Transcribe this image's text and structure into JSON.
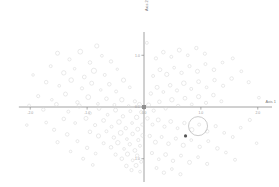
{
  "chart_data": {
    "type": "scatter",
    "title": "",
    "subtitle": "",
    "xlabel": "Axis 1",
    "ylabel": "Axis 2",
    "xlim": [
      -2.2,
      2.25
    ],
    "ylim": [
      -1.45,
      1.45
    ],
    "xticks": [
      -2.0,
      -1.0,
      0.0,
      1.0,
      2.0
    ],
    "xticklabels": [
      "-2.0",
      "-1.0",
      "0.0",
      "1.0",
      "2.0"
    ],
    "yticks": [
      1.0,
      0.0,
      -1.0
    ],
    "yticklabels": [
      "1.0",
      "0.0",
      "-1.0"
    ],
    "grid": false,
    "legend": null,
    "legend_position": "none",
    "marker_style": "open-circle",
    "marker_color": "#d8d8d8",
    "annotations": [
      {
        "label": "large open circle",
        "x": 0.95,
        "y": -0.37,
        "size": 9.5
      },
      {
        "label": "dark filled marker",
        "x": 0.73,
        "y": -0.56,
        "size": 3.2
      },
      {
        "label": "dark cluster at origin",
        "x": 0.0,
        "y": 0.0,
        "size": 4.0
      }
    ],
    "series": [
      {
        "name": "samples",
        "points": [
          [
            -1.52,
            1.04,
            2.0
          ],
          [
            -1.31,
            0.92,
            1.6
          ],
          [
            -1.12,
            1.07,
            2.4
          ],
          [
            -0.95,
            0.86,
            1.8
          ],
          [
            -0.83,
            1.18,
            2.1
          ],
          [
            -0.74,
            0.99,
            1.4
          ],
          [
            -1.64,
            0.79,
            1.5
          ],
          [
            -1.41,
            0.66,
            2.2
          ],
          [
            -1.22,
            0.74,
            1.3
          ],
          [
            -1.05,
            0.58,
            1.9
          ],
          [
            -0.88,
            0.7,
            2.6
          ],
          [
            -0.69,
            0.62,
            1.5
          ],
          [
            -0.58,
            0.88,
            1.7
          ],
          [
            -0.47,
            0.73,
            1.2
          ],
          [
            -1.72,
            0.48,
            1.8
          ],
          [
            -1.49,
            0.41,
            1.4
          ],
          [
            -1.28,
            0.52,
            2.3
          ],
          [
            -1.09,
            0.36,
            1.6
          ],
          [
            -0.92,
            0.46,
            2.0
          ],
          [
            -0.76,
            0.33,
            1.3
          ],
          [
            -0.61,
            0.44,
            1.8
          ],
          [
            -0.49,
            0.3,
            1.5
          ],
          [
            -0.36,
            0.52,
            2.1
          ],
          [
            -0.25,
            0.38,
            1.4
          ],
          [
            -1.86,
            0.21,
            1.6
          ],
          [
            -1.62,
            0.14,
            1.3
          ],
          [
            -1.38,
            0.25,
            2.0
          ],
          [
            -1.17,
            0.09,
            1.7
          ],
          [
            -0.98,
            0.19,
            2.4
          ],
          [
            -0.81,
            0.06,
            1.4
          ],
          [
            -0.66,
            0.16,
            1.8
          ],
          [
            -0.52,
            0.04,
            1.5
          ],
          [
            -0.39,
            0.14,
            2.2
          ],
          [
            -0.27,
            0.02,
            1.3
          ],
          [
            -0.16,
            0.11,
            1.6
          ],
          [
            -0.08,
            0.05,
            2.0
          ],
          [
            -2.02,
            0.03,
            1.4
          ],
          [
            -1.77,
            -0.05,
            1.7
          ],
          [
            -1.54,
            0.05,
            1.9
          ],
          [
            -1.33,
            -0.09,
            1.5
          ],
          [
            -1.14,
            0.02,
            2.1
          ],
          [
            -0.95,
            -0.12,
            1.6
          ],
          [
            -0.79,
            -0.03,
            1.8
          ],
          [
            -0.64,
            -0.15,
            1.4
          ],
          [
            -0.5,
            -0.06,
            2.0
          ],
          [
            -0.37,
            -0.18,
            1.7
          ],
          [
            -0.24,
            -0.08,
            1.5
          ],
          [
            -0.13,
            -0.2,
            2.2
          ],
          [
            -0.05,
            -0.1,
            1.6
          ],
          [
            -1.41,
            -0.23,
            1.8
          ],
          [
            -1.21,
            -0.31,
            1.4
          ],
          [
            -1.02,
            -0.22,
            2.0
          ],
          [
            -0.86,
            -0.35,
            1.6
          ],
          [
            -0.71,
            -0.26,
            1.9
          ],
          [
            -0.57,
            -0.38,
            1.5
          ],
          [
            -0.44,
            -0.29,
            2.3
          ],
          [
            -0.32,
            -0.41,
            1.7
          ],
          [
            -0.21,
            -0.31,
            1.4
          ],
          [
            -0.11,
            -0.43,
            2.0
          ],
          [
            -0.03,
            -0.34,
            1.6
          ],
          [
            -0.95,
            -0.48,
            1.8
          ],
          [
            -0.8,
            -0.56,
            2.1
          ],
          [
            -0.66,
            -0.47,
            1.5
          ],
          [
            -0.53,
            -0.59,
            1.7
          ],
          [
            -0.41,
            -0.5,
            2.4
          ],
          [
            -0.3,
            -0.62,
            1.4
          ],
          [
            -0.2,
            -0.52,
            1.8
          ],
          [
            -0.1,
            -0.64,
            1.6
          ],
          [
            -0.02,
            -0.55,
            2.0
          ],
          [
            -0.71,
            -0.7,
            1.5
          ],
          [
            -0.58,
            -0.78,
            1.8
          ],
          [
            -0.46,
            -0.69,
            2.2
          ],
          [
            -0.35,
            -0.81,
            1.4
          ],
          [
            -0.25,
            -0.72,
            1.7
          ],
          [
            -0.16,
            -0.84,
            1.9
          ],
          [
            -0.07,
            -0.75,
            1.5
          ],
          [
            -0.5,
            -0.92,
            1.6
          ],
          [
            -0.39,
            -1.0,
            1.8
          ],
          [
            -0.29,
            -0.91,
            2.1
          ],
          [
            -0.2,
            -1.03,
            1.4
          ],
          [
            -0.12,
            -0.94,
            1.7
          ],
          [
            -0.05,
            -1.06,
            1.5
          ],
          [
            -0.31,
            -1.14,
            1.8
          ],
          [
            -0.22,
            -1.22,
            1.6
          ],
          [
            -0.14,
            -1.13,
            2.0
          ],
          [
            -0.07,
            -1.25,
            1.4
          ],
          [
            -1.58,
            -0.44,
            1.6
          ],
          [
            -1.72,
            -0.3,
            1.4
          ],
          [
            -1.35,
            -0.53,
            1.8
          ],
          [
            -1.17,
            -0.66,
            1.5
          ],
          [
            -1.0,
            -0.79,
            1.7
          ],
          [
            -0.85,
            -0.9,
            1.4
          ],
          [
            -1.52,
            -0.68,
            1.6
          ],
          [
            -1.29,
            -0.86,
            1.3
          ],
          [
            -1.07,
            -1.0,
            1.5
          ],
          [
            -0.9,
            -1.12,
            1.4
          ],
          [
            0.08,
            0.04,
            2.0
          ],
          [
            0.17,
            -0.07,
            1.6
          ],
          [
            0.27,
            0.1,
            1.8
          ],
          [
            0.38,
            -0.03,
            1.5
          ],
          [
            0.49,
            0.14,
            2.2
          ],
          [
            0.6,
            0.02,
            1.7
          ],
          [
            0.72,
            0.17,
            1.9
          ],
          [
            0.84,
            0.05,
            1.4
          ],
          [
            0.96,
            0.2,
            2.1
          ],
          [
            1.09,
            0.08,
            1.6
          ],
          [
            1.22,
            0.23,
            1.8
          ],
          [
            1.36,
            0.11,
            1.5
          ],
          [
            0.12,
            0.26,
            1.7
          ],
          [
            0.23,
            0.38,
            2.0
          ],
          [
            0.34,
            0.29,
            1.4
          ],
          [
            0.46,
            0.42,
            1.8
          ],
          [
            0.58,
            0.32,
            1.6
          ],
          [
            0.7,
            0.46,
            2.3
          ],
          [
            0.83,
            0.35,
            1.5
          ],
          [
            0.96,
            0.49,
            1.9
          ],
          [
            1.1,
            0.38,
            1.4
          ],
          [
            1.24,
            0.52,
            1.7
          ],
          [
            1.39,
            0.41,
            1.6
          ],
          [
            1.54,
            0.55,
            1.8
          ],
          [
            0.16,
            0.6,
            1.5
          ],
          [
            0.28,
            0.72,
            1.9
          ],
          [
            0.4,
            0.63,
            2.1
          ],
          [
            0.53,
            0.76,
            1.4
          ],
          [
            0.66,
            0.66,
            1.7
          ],
          [
            0.8,
            0.79,
            1.6
          ],
          [
            0.94,
            0.69,
            2.0
          ],
          [
            1.08,
            0.83,
            1.5
          ],
          [
            1.23,
            0.72,
            1.8
          ],
          [
            1.38,
            0.86,
            1.4
          ],
          [
            0.21,
            0.94,
            1.6
          ],
          [
            0.34,
            1.06,
            1.8
          ],
          [
            0.48,
            0.97,
            1.5
          ],
          [
            0.62,
            1.1,
            2.0
          ],
          [
            0.77,
            1.0,
            1.4
          ],
          [
            0.92,
            1.14,
            1.7
          ],
          [
            1.07,
            1.03,
            1.6
          ],
          [
            1.56,
            0.94,
            1.5
          ],
          [
            1.71,
            0.69,
            1.4
          ],
          [
            1.84,
            0.48,
            1.6
          ],
          [
            0.06,
            -0.22,
            1.8
          ],
          [
            0.15,
            -0.34,
            1.5
          ],
          [
            0.25,
            -0.25,
            2.0
          ],
          [
            0.36,
            -0.38,
            1.6
          ],
          [
            0.47,
            -0.28,
            1.9
          ],
          [
            0.59,
            -0.41,
            1.4
          ],
          [
            0.71,
            -0.31,
            1.7
          ],
          [
            0.84,
            -0.44,
            2.2
          ],
          [
            0.97,
            -0.34,
            1.5
          ],
          [
            1.11,
            -0.47,
            1.8
          ],
          [
            1.26,
            -0.37,
            1.6
          ],
          [
            1.41,
            -0.5,
            1.4
          ],
          [
            0.1,
            -0.56,
            1.7
          ],
          [
            0.2,
            -0.68,
            2.0
          ],
          [
            0.31,
            -0.58,
            1.5
          ],
          [
            0.43,
            -0.71,
            1.8
          ],
          [
            0.56,
            -0.61,
            1.6
          ],
          [
            0.69,
            -0.74,
            2.1
          ],
          [
            0.83,
            -0.64,
            1.4
          ],
          [
            0.98,
            -0.77,
            1.7
          ],
          [
            1.13,
            -0.66,
            1.5
          ],
          [
            1.29,
            -0.8,
            1.8
          ],
          [
            0.14,
            -0.89,
            1.6
          ],
          [
            0.26,
            -1.01,
            1.4
          ],
          [
            0.38,
            -0.92,
            1.9
          ],
          [
            0.51,
            -1.04,
            1.7
          ],
          [
            0.65,
            -0.94,
            1.5
          ],
          [
            0.8,
            -1.07,
            2.0
          ],
          [
            0.95,
            -0.97,
            1.4
          ],
          [
            1.11,
            -1.1,
            1.6
          ],
          [
            0.22,
            -1.18,
            1.5
          ],
          [
            0.35,
            -1.27,
            1.7
          ],
          [
            0.49,
            -1.2,
            1.4
          ],
          [
            0.64,
            -1.3,
            1.6
          ],
          [
            1.56,
            -0.58,
            1.5
          ],
          [
            1.7,
            -0.4,
            1.4
          ],
          [
            1.86,
            -0.25,
            1.6
          ],
          [
            1.44,
            -0.88,
            1.4
          ],
          [
            1.6,
            -1.02,
            1.5
          ],
          [
            2.02,
            0.18,
            1.4
          ],
          [
            -1.95,
            0.62,
            1.3
          ],
          [
            -2.06,
            -0.35,
            1.3
          ],
          [
            1.98,
            -0.7,
            1.3
          ],
          [
            0.05,
            1.24,
            1.5
          ]
        ]
      }
    ]
  },
  "axis_titles": {
    "x": "Axis 1",
    "y": "Axis 2"
  }
}
